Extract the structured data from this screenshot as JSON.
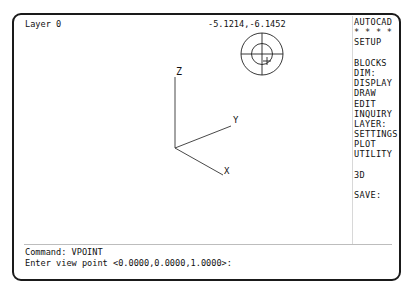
{
  "status": {
    "layer": "Layer 0",
    "coordinates": "-5.1214,-6.1452"
  },
  "viewport": {
    "axes": {
      "x_label": "X",
      "y_label": "Y",
      "z_label": "Z"
    },
    "compass": "vpoint-compass-globe"
  },
  "side_menu": {
    "items": [
      {
        "label": "AUTOCAD"
      },
      {
        "label": "* * * *"
      },
      {
        "label": "SETUP"
      },
      {
        "label": ""
      },
      {
        "label": "BLOCKS"
      },
      {
        "label": "DIM:"
      },
      {
        "label": "DISPLAY"
      },
      {
        "label": "DRAW"
      },
      {
        "label": "EDIT"
      },
      {
        "label": "INQUIRY"
      },
      {
        "label": "LAYER:"
      },
      {
        "label": "SETTINGS"
      },
      {
        "label": "PLOT"
      },
      {
        "label": "UTILITY"
      },
      {
        "label": ""
      },
      {
        "label": "3D"
      },
      {
        "label": ""
      },
      {
        "label": "SAVE:"
      }
    ]
  },
  "command_line": {
    "line1": "Command: VPOINT",
    "line2": "Enter view point <0.0000,0.0000,1.0000>:"
  }
}
